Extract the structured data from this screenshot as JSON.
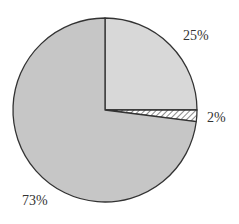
{
  "chart_data": {
    "type": "pie",
    "title": "",
    "start_angle_deg": 0,
    "direction": "clockwise",
    "slices": [
      {
        "label": "25%",
        "value": 25,
        "color": "#d8d8d8",
        "pattern": "solid"
      },
      {
        "label": "2%",
        "value": 2,
        "color": "#ffffff",
        "pattern": "hatch"
      },
      {
        "label": "73%",
        "value": 73,
        "color": "#c6c6c6",
        "pattern": "solid"
      }
    ],
    "legend": null
  },
  "labels": {
    "slice_0": "25%",
    "slice_1": "2%",
    "slice_2": "73%"
  },
  "colors": {
    "outline": "#333333",
    "hatch_line": "#8a8a8a"
  }
}
